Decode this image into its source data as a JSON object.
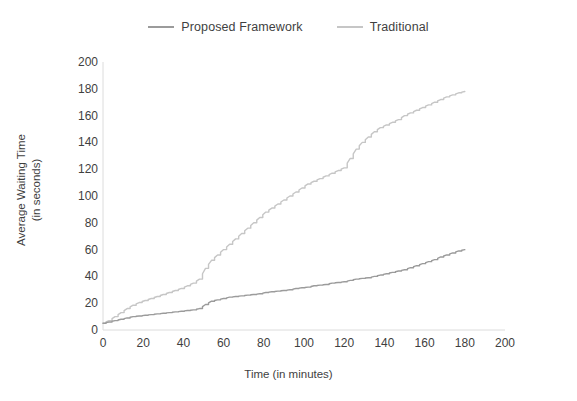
{
  "chart_data": {
    "type": "line",
    "title": "",
    "xlabel": "Time (in minutes)",
    "ylabel": "Average Waiting Time (in seconds)",
    "ylabel_line1": "Average Waiting Time",
    "ylabel_line2": "(in seconds)",
    "xlim": [
      0,
      200
    ],
    "ylim": [
      0,
      200
    ],
    "xticks": [
      0,
      20,
      40,
      60,
      80,
      100,
      120,
      140,
      160,
      180,
      200
    ],
    "yticks": [
      0,
      20,
      40,
      60,
      80,
      100,
      120,
      140,
      160,
      180,
      200
    ],
    "grid": false,
    "legend_position": "top-center",
    "x": [
      0,
      3,
      6,
      9,
      12,
      15,
      18,
      21,
      24,
      27,
      30,
      33,
      36,
      39,
      42,
      45,
      48,
      51,
      54,
      57,
      60,
      63,
      66,
      69,
      72,
      75,
      78,
      81,
      84,
      87,
      90,
      93,
      96,
      99,
      102,
      105,
      108,
      111,
      114,
      117,
      120,
      123,
      126,
      129,
      132,
      135,
      138,
      141,
      144,
      147,
      150,
      153,
      156,
      159,
      162,
      165,
      168,
      171,
      174,
      177,
      180
    ],
    "series": [
      {
        "name": "Proposed Framework",
        "color": "#9b9b9b",
        "values": [
          5,
          6,
          7,
          8,
          9,
          10,
          10.5,
          11,
          11.5,
          12,
          12.5,
          13,
          13.5,
          14,
          14.5,
          15,
          16,
          19,
          21.5,
          22.5,
          23.5,
          24.5,
          25,
          25.5,
          26,
          26.5,
          27,
          28,
          28.5,
          29,
          29.5,
          30,
          31,
          31.5,
          32,
          33,
          33.5,
          34,
          35,
          35.5,
          36,
          37,
          38,
          38.5,
          39,
          40,
          41,
          42,
          43,
          44,
          45,
          46.5,
          48,
          49.5,
          51,
          52.5,
          54.5,
          56,
          57.5,
          59,
          60
        ]
      },
      {
        "name": "Traditional",
        "color": "#c6c6c6",
        "values": [
          5,
          7,
          10,
          13,
          16,
          18.5,
          20.5,
          22,
          23.5,
          25,
          26.5,
          28,
          29.5,
          31,
          33,
          35,
          38,
          46,
          52,
          56,
          60,
          64,
          68,
          72,
          76,
          80,
          84,
          88,
          91,
          94,
          97,
          100,
          103,
          106,
          109,
          111,
          113,
          115,
          117,
          119,
          121,
          128,
          135,
          140,
          144,
          148,
          151,
          153,
          155,
          157,
          160,
          162,
          164,
          166,
          168,
          170,
          172,
          174,
          175.5,
          177,
          178
        ]
      }
    ]
  },
  "legend": {
    "items": [
      {
        "label": "Proposed Framework",
        "color": "#9b9b9b"
      },
      {
        "label": "Traditional",
        "color": "#c6c6c6"
      }
    ]
  },
  "axes": {
    "axis_color": "#d9d9d9",
    "text_color": "#3f3f3f"
  }
}
